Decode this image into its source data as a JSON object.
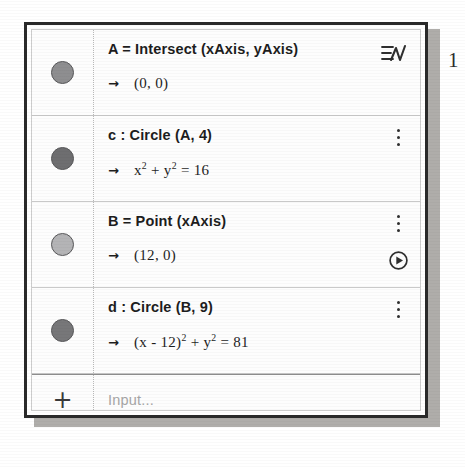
{
  "page": {
    "edge_number": "1"
  },
  "panel": {
    "name": "algebra-view",
    "input_row": {
      "add_label": "+",
      "placeholder": "Input...",
      "placeholder_text": "Input..."
    },
    "header_icon": "menu-chart-icon"
  },
  "rows": [
    {
      "marker_color": "#8e8e90",
      "definition": "A = Intersect (xAxis, yAxis)",
      "arrow": "→",
      "output": "(0, 0)",
      "icons": [
        "menu-chart-icon"
      ]
    },
    {
      "marker_color": "#6e6e70",
      "definition": "c : Circle (A, 4)",
      "arrow": "→",
      "output_html": "x<sup>2</sup> + y<sup>2</sup> = 16",
      "output": "x² + y² = 16",
      "icons": [
        "kebab-menu-icon"
      ]
    },
    {
      "marker_color": "#b4b4b6",
      "definition": "B = Point (xAxis)",
      "arrow": "→",
      "output": "(12, 0)",
      "icons": [
        "kebab-menu-icon",
        "play-animate-icon"
      ]
    },
    {
      "marker_color": "#777779",
      "definition": "d : Circle (B, 9)",
      "arrow": "→",
      "output_html": "(x - 12)<sup>2</sup> + y<sup>2</sup> = 81",
      "output": "(x - 12)² + y² = 81",
      "icons": [
        "kebab-menu-icon"
      ]
    }
  ],
  "colors": {
    "frame": "#2a2a2a",
    "text": "#1d1d1d",
    "placeholder": "#a6a6a6",
    "divider": "#c9c9c9",
    "shadow": "#9e9b97"
  }
}
